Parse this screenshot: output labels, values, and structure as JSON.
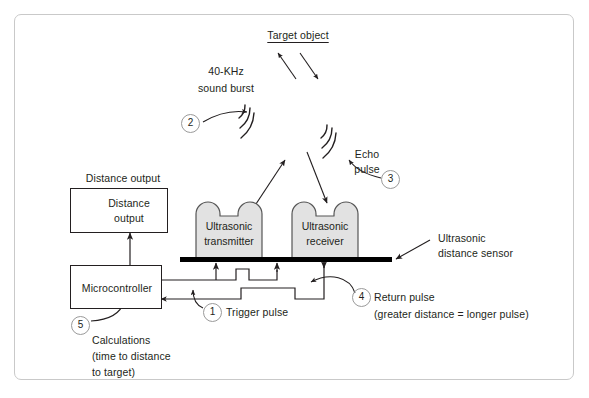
{
  "diagram": {
    "colors": {
      "frame_border": "#c9c9c9",
      "ink": "#231f20",
      "transducer_fill": "#e2e2e2",
      "sensor_bar": "#000000",
      "marker_outline": "#9a9a9a"
    },
    "target": {
      "label": "Target object"
    },
    "sound_burst": {
      "line1": "40-KHz",
      "line2": "sound burst"
    },
    "echo": {
      "line1": "Echo",
      "line2": "pulse"
    },
    "sensor_callout": {
      "line1": "Ultrasonic",
      "line2": "distance sensor"
    },
    "transmitter": {
      "line1": "Ultrasonic",
      "line2": "transmitter"
    },
    "receiver": {
      "line1": "Ultrasonic",
      "line2": "receiver"
    },
    "distance_output_caption": "Distance output",
    "distance_output_box": {
      "line1": "Distance",
      "line2": "output"
    },
    "microcontroller": {
      "label": "Microcontroller"
    },
    "trigger": {
      "label": "Trigger pulse"
    },
    "return_pulse": {
      "line1": "Return pulse",
      "line2": "(greater distance = longer pulse)"
    },
    "calculations": {
      "line1": "Calculations",
      "line2": "(time to distance",
      "line3": "to target)"
    },
    "markers": {
      "one": "1",
      "two": "2",
      "three": "3",
      "four": "4",
      "five": "5",
      "six": "6"
    }
  }
}
